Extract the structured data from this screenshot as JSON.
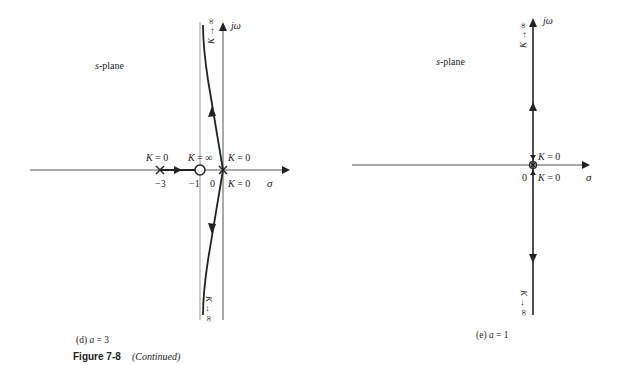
{
  "figure": {
    "title_bold": "Figure 7-8",
    "title_note": "(Continued)"
  },
  "panel_d": {
    "caption": "(d) a = 3",
    "plane_label_s": "s",
    "plane_label_rest": "-plane",
    "axis_real_label": "σ",
    "axis_imag_label": "jω",
    "tick_labels": [
      "−3",
      "−1",
      "0"
    ],
    "pole_label_left": "K = 0",
    "zero_label": "K = ∞",
    "origin_label_top": "K = 0",
    "origin_label_bottom": "K = 0",
    "branch_top_label": "K → ∞",
    "branch_bottom_label": "K → ∞",
    "poles": [
      -3,
      0,
      0
    ],
    "zeros": [
      -1
    ],
    "asymptote_sigma": -1
  },
  "panel_e": {
    "caption": "(e) a = 1",
    "plane_label_s": "s",
    "plane_label_rest": "-plane",
    "axis_real_label": "σ",
    "axis_imag_label": "jω",
    "tick_labels": [
      "0"
    ],
    "origin_label_top": "K = 0",
    "origin_label_bottom": "K = 0",
    "branch_top_label": "K → ∞",
    "branch_bottom_label": "K → ∞",
    "poles": [
      0,
      0
    ],
    "zeros": []
  },
  "colors": {
    "ink": "#222222",
    "asymptote": "#888888",
    "background": "#ffffff"
  }
}
